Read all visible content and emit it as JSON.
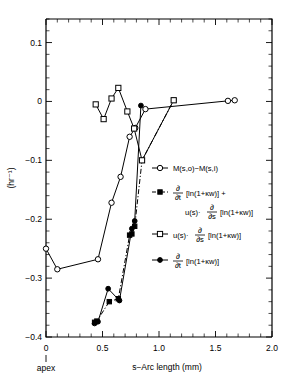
{
  "figure": {
    "name": "corneal-endothelium-rate-plot",
    "background": "#ffffff",
    "foreground": "#000000"
  },
  "chart_data": {
    "type": "line",
    "title": "",
    "subtitle": "",
    "xlabel": "s−Arc length (mm)",
    "ylabel": "(hr⁻¹)",
    "xlim": [
      0,
      2.0
    ],
    "ylim": [
      -0.4,
      0.14
    ],
    "grid": false,
    "legend_position": "center-right-inside",
    "x_ticks_major": [
      0,
      0.5,
      1.0,
      1.5,
      2.0
    ],
    "x_ticklabels": [
      "0",
      "0.5",
      "1.0",
      "1.5",
      "2.0"
    ],
    "x_minor_interval": 0.1,
    "y_ticks_major": [
      0.1,
      0,
      -0.1,
      -0.2,
      -0.3,
      -0.4
    ],
    "y_ticklabels": [
      "0.1",
      "0",
      "−0.1",
      "−0.2",
      "−0.3",
      "−0.4"
    ],
    "y_minor_interval": 0.02,
    "origin_annotation": "apex",
    "series": [
      {
        "name": "M(s,o)−M(s,i)",
        "legend_label_parts": {
          "main": "M(s,o)−M(s,i)"
        },
        "marker": "open-circle",
        "line": "solid",
        "x": [
          0.0,
          0.1,
          0.46,
          0.58,
          0.66,
          0.74,
          0.79,
          0.88,
          1.61,
          1.67
        ],
        "y": [
          -0.25,
          -0.285,
          -0.268,
          -0.172,
          -0.128,
          -0.06,
          -0.045,
          -0.013,
          0.001,
          0.002
        ]
      },
      {
        "name": "d/dt[ln(1+Kw)] + u(s)·d/ds[ln(1+Kw)]",
        "legend_label_parts": {
          "frac_num": "∂",
          "frac_den": "∂t",
          "bracket1": "[ln(1+κw)]",
          "plus": "+",
          "second_line_pre": "u(s)·",
          "frac2_num": "∂",
          "frac2_den": "∂s",
          "bracket2": "[ln(1+κw)]"
        },
        "marker": "filled-square",
        "line": "dash-dot",
        "x": [
          0.43,
          0.45,
          0.56,
          0.64,
          0.74,
          0.76,
          0.785,
          0.85,
          1.13
        ],
        "y": [
          -0.375,
          -0.373,
          -0.34,
          -0.335,
          -0.227,
          -0.225,
          -0.212,
          -0.1,
          0.002
        ]
      },
      {
        "name": "u(s)·d/ds[ln(1+Kw)]",
        "legend_label_parts": {
          "pre": "u(s)·",
          "frac_num": "∂",
          "frac_den": "∂s",
          "bracket": "[ln(1+κw)]"
        },
        "marker": "open-square",
        "line": "solid",
        "x": [
          0.44,
          0.51,
          0.58,
          0.64,
          0.72,
          0.78,
          0.85,
          1.13
        ],
        "y": [
          -0.005,
          -0.03,
          0.005,
          0.023,
          -0.017,
          -0.046,
          -0.1,
          0.002
        ]
      },
      {
        "name": "d/dt[ln(1+Kw)]",
        "legend_label_parts": {
          "frac_num": "∂",
          "frac_den": "∂t",
          "bracket": "[ln(1+κw)]"
        },
        "marker": "filled-circle",
        "line": "solid",
        "x": [
          0.43,
          0.46,
          0.55,
          0.65,
          0.76,
          0.785,
          0.84
        ],
        "y": [
          -0.377,
          -0.374,
          -0.318,
          -0.338,
          -0.216,
          -0.203,
          -0.007
        ]
      }
    ]
  }
}
